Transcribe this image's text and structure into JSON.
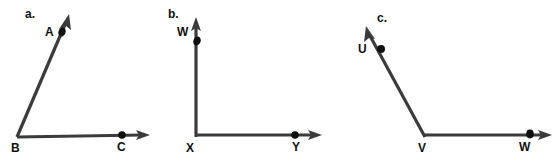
{
  "figure": {
    "background_color": "#ffffff",
    "stroke_color": "#3b3b3b",
    "dot_color": "#111111",
    "label_color": "#111111",
    "parts": [
      {
        "id": "a",
        "part_label": "a.",
        "part_label_x": 25,
        "part_label_y": 18,
        "vertex": {
          "name": "B",
          "x": 17,
          "y": 137,
          "label_x": 11,
          "label_y": 152
        },
        "rays": [
          {
            "endpoint_name": "A",
            "dot_x": 62,
            "dot_y": 32,
            "label": "A",
            "label_x": 45,
            "label_y": 36,
            "tip_x": 69,
            "tip_y": 14
          },
          {
            "endpoint_name": "C",
            "dot_x": 122,
            "dot_y": 135,
            "label": "C",
            "label_x": 117,
            "label_y": 151,
            "tip_x": 150,
            "tip_y": 135
          }
        ]
      },
      {
        "id": "b",
        "part_label": "b.",
        "part_label_x": 168,
        "part_label_y": 18,
        "vertex": {
          "name": "X",
          "x": 196,
          "y": 137,
          "label_x": 186,
          "label_y": 152
        },
        "rays": [
          {
            "endpoint_name": "W",
            "dot_x": 197,
            "dot_y": 41,
            "label": "W",
            "label_x": 177,
            "label_y": 36,
            "tip_x": 196,
            "tip_y": 17
          },
          {
            "endpoint_name": "Y",
            "dot_x": 295,
            "dot_y": 135,
            "label": "Y",
            "label_x": 292,
            "label_y": 151,
            "tip_x": 322,
            "tip_y": 135
          }
        ]
      },
      {
        "id": "c",
        "part_label": "c.",
        "part_label_x": 377,
        "part_label_y": 22,
        "vertex": {
          "name": "V",
          "x": 425,
          "y": 137,
          "label_x": 418,
          "label_y": 152
        },
        "rays": [
          {
            "endpoint_name": "U",
            "dot_x": 381,
            "dot_y": 49,
            "label": "U",
            "label_x": 358,
            "label_y": 53,
            "tip_x": 366,
            "tip_y": 26
          },
          {
            "endpoint_name": "W",
            "dot_x": 530,
            "dot_y": 135,
            "label": "W",
            "label_x": 519,
            "label_y": 151,
            "tip_x": 552,
            "tip_y": 135
          }
        ]
      }
    ]
  }
}
